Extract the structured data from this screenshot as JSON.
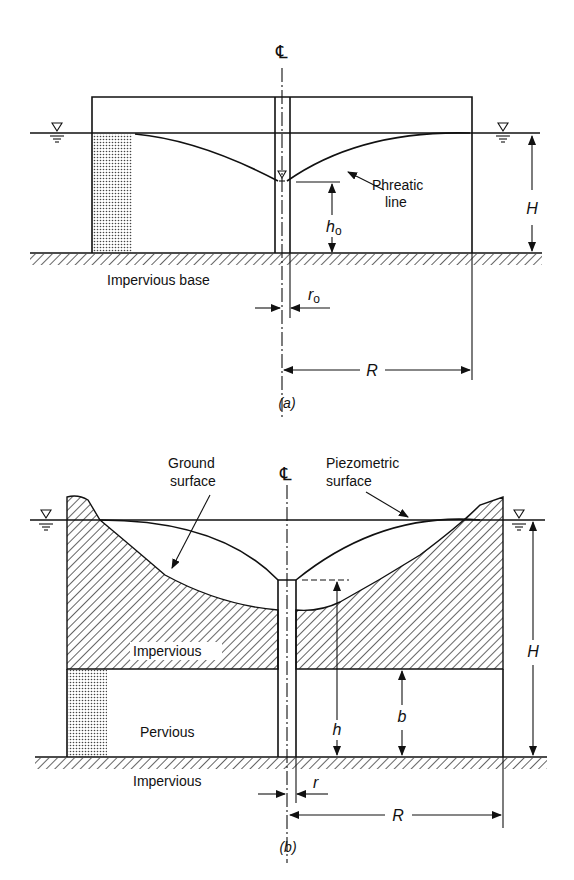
{
  "figure_a": {
    "caption": "(a)",
    "centerline_symbol": "℄",
    "labels": {
      "phreatic_line_1": "Phreatic",
      "phreatic_line_2": "line",
      "impervious_base": "Impervious base",
      "h0": "h",
      "h0_sub": "o",
      "r0": "r",
      "r0_sub": "o",
      "H": "H",
      "R": "R"
    }
  },
  "figure_b": {
    "caption": "(b)",
    "centerline_symbol": "℄",
    "labels": {
      "ground_surface_1": "Ground",
      "ground_surface_2": "surface",
      "piezometric_surface_1": "Piezometric",
      "piezometric_surface_2": "surface",
      "impervious_upper": "Impervious",
      "pervious": "Pervious",
      "impervious_base": "Impervious",
      "h": "h",
      "b": "b",
      "r": "r",
      "H": "H",
      "R": "R"
    }
  },
  "colors": {
    "ink": "#111111",
    "paper": "#ffffff"
  }
}
